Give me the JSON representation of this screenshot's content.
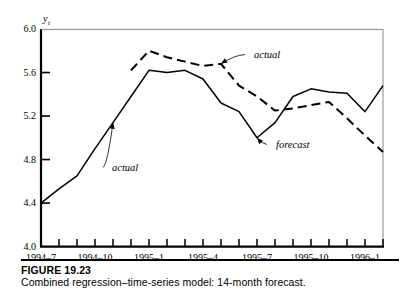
{
  "figure": {
    "caption_title": "FIGURE 19.23",
    "caption_text": "Combined regression–time-series model: 14-month forecast."
  },
  "chart_data": {
    "type": "line",
    "title": "",
    "xlabel": "",
    "ylabel": "y_t",
    "ylabel_display": "y",
    "ylabel_subscript": "t",
    "ylim": [
      4.0,
      6.0
    ],
    "ytick_values": [
      6.0,
      5.6,
      5.2,
      4.8,
      4.4,
      4.0
    ],
    "ytick_labels": [
      "6.0",
      "5.6",
      "5.2",
      "4.8",
      "4.4",
      "4.0"
    ],
    "grid": false,
    "legend_position": "none",
    "x": [
      "1994-7",
      "1994-8",
      "1994-9",
      "1994-10",
      "1994-11",
      "1994-12",
      "1995-1",
      "1995-2",
      "1995-3",
      "1995-4",
      "1995-5",
      "1995-6",
      "1995-7",
      "1995-8",
      "1995-9",
      "1995-10",
      "1995-11",
      "1995-12",
      "1996-1",
      "1996-2"
    ],
    "xtick_labels": [
      "1994–7",
      "1994–10",
      "1995–1",
      "1995–4",
      "1995–7",
      "1995–10",
      "1996–1"
    ],
    "xtick_label_indices": [
      0,
      3,
      6,
      9,
      12,
      15,
      18
    ],
    "series": [
      {
        "name": "actual",
        "style": "solid",
        "color": "#000000",
        "values": [
          4.4,
          4.53,
          4.65,
          4.9,
          5.14,
          5.38,
          5.62,
          5.6,
          5.62,
          5.54,
          5.32,
          5.24,
          5.0,
          5.14,
          5.38,
          5.45,
          5.42,
          5.41,
          5.24,
          5.48
        ]
      },
      {
        "name": "forecast",
        "style": "dashed",
        "color": "#000000",
        "values": [
          null,
          null,
          null,
          null,
          null,
          5.62,
          5.8,
          5.74,
          5.7,
          5.66,
          5.68,
          5.48,
          5.38,
          5.25,
          5.27,
          5.3,
          5.33,
          5.18,
          5.02,
          4.87
        ]
      }
    ],
    "annotations": [
      {
        "text": "actual",
        "series": "actual",
        "target_index": 4,
        "label_x": 112,
        "label_y": 171
      },
      {
        "text": "actual",
        "series": "forecast",
        "target_index": 10,
        "label_x": 254,
        "label_y": 58
      },
      {
        "text": "forecast",
        "series": "actual",
        "target_index": 12,
        "label_x": 276,
        "label_y": 148
      }
    ]
  }
}
